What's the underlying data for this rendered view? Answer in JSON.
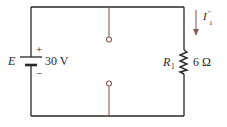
{
  "diagram": {
    "type": "circuit",
    "source": {
      "name": "E",
      "value": "30 V",
      "plus": "+",
      "minus": "−"
    },
    "resistor": {
      "name": "R",
      "subscript": "1",
      "value": "6 Ω"
    },
    "current": {
      "name": "I",
      "prime": "″",
      "subscript": "1"
    },
    "open_terminals": 2,
    "colors": {
      "wire": "#2a2626",
      "terminal": "#8a5a5a",
      "arrow": "#8a5a5a"
    }
  }
}
